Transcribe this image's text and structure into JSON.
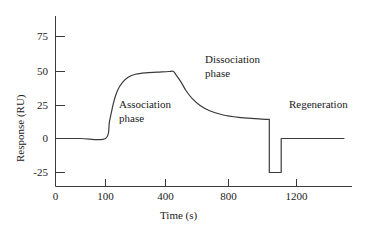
{
  "chart_data": {
    "type": "line",
    "title": "",
    "subtitle": "",
    "xlabel": "Time (s)",
    "ylabel": "Response (RU)",
    "grid": false,
    "legend": "none",
    "xticks": [
      0,
      100,
      400,
      800,
      1200
    ],
    "xtick_labels": [
      "0",
      "100",
      "400",
      "800",
      "1200"
    ],
    "yticks": [
      -25,
      0,
      25,
      50,
      75
    ],
    "ytick_labels": [
      "-25",
      "0",
      "25",
      "50",
      "75"
    ],
    "xlim": [
      0,
      1480
    ],
    "ylim": [
      -35,
      90
    ],
    "annotations": [
      {
        "text_line1": "Association",
        "text_line2": "phase",
        "x": 170,
        "y": 22
      },
      {
        "text_line1": "Dissociation",
        "text_line2": "phase",
        "x": 700,
        "y": 60
      },
      {
        "text_line1": "Regeneration",
        "text_line2": "",
        "x": 1210,
        "y": 22
      }
    ],
    "series": [
      {
        "name": "sensorgram",
        "description": "SPR sensorgram: baseline, association, dissociation, regeneration pulse, restored baseline",
        "points": [
          [
            0,
            0
          ],
          [
            50,
            0
          ],
          [
            100,
            0
          ],
          [
            120,
            13
          ],
          [
            140,
            27
          ],
          [
            160,
            36
          ],
          [
            185,
            42
          ],
          [
            215,
            46
          ],
          [
            250,
            48
          ],
          [
            300,
            49
          ],
          [
            360,
            49.5
          ],
          [
            420,
            50
          ],
          [
            450,
            50
          ],
          [
            470,
            47
          ],
          [
            500,
            42
          ],
          [
            530,
            36
          ],
          [
            570,
            30
          ],
          [
            620,
            25
          ],
          [
            680,
            21
          ],
          [
            760,
            18
          ],
          [
            860,
            16
          ],
          [
            960,
            15
          ],
          [
            1020,
            14.5
          ],
          [
            1040,
            14.5
          ],
          [
            1040,
            -25
          ],
          [
            1110,
            -25
          ],
          [
            1110,
            0
          ],
          [
            1480,
            0
          ]
        ]
      }
    ]
  },
  "axis": {
    "ytick_0": "75",
    "ytick_1": "50",
    "ytick_2": "25",
    "ytick_3": "0",
    "ytick_4": "-25",
    "xtick_0": "0",
    "xtick_1": "100",
    "xtick_2": "400",
    "xtick_3": "800",
    "xtick_4": "1200",
    "x_title": "Time (s)",
    "y_title": "Response (RU)"
  },
  "labels": {
    "association_line1": "Association",
    "association_line2": "phase",
    "dissociation_line1": "Dissociation",
    "dissociation_line2": "phase",
    "regeneration": "Regeneration"
  },
  "colors": {
    "line": "#3a3a3a",
    "axis": "#3a3a3a",
    "text": "#1a1a1a",
    "background": "#ffffff"
  }
}
